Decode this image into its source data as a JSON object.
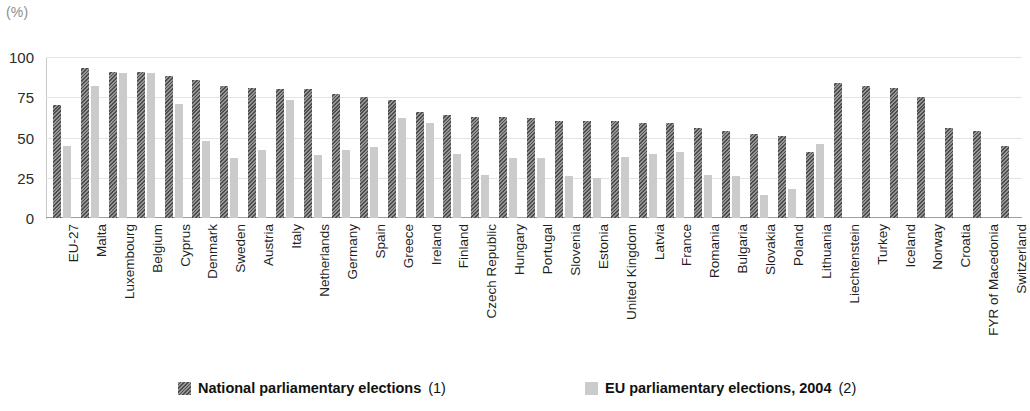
{
  "chart_data": {
    "type": "bar",
    "title": "",
    "xlabel": "",
    "ylabel": "(%)",
    "unit_label": "(%)",
    "ylim": [
      0,
      100
    ],
    "yticks": [
      0,
      25,
      50,
      75,
      100
    ],
    "grid": true,
    "legend_position": "bottom",
    "categories": [
      "EU-27",
      "Malta",
      "Luxembourg",
      "Belgium",
      "Cyprus",
      "Denmark",
      "Sweden",
      "Austria",
      "Italy",
      "Netherlands",
      "Germany",
      "Spain",
      "Greece",
      "Ireland",
      "Finland",
      "Czech Republic",
      "Hungary",
      "Portugal",
      "Slovenia",
      "Estonia",
      "United Kingdom",
      "Latvia",
      "France",
      "Romania",
      "Bulgaria",
      "Slovakia",
      "Poland",
      "Lithuania",
      "Liechtenstein",
      "Turkey",
      "Iceland",
      "Norway",
      "Croatia",
      "FYR of Macedonia",
      "Switzerland"
    ],
    "series": [
      {
        "name": "National parliamentary elections (1)",
        "color": "#6e6e6e",
        "pattern": "diagonal-hatch",
        "values": [
          70,
          93,
          91,
          91,
          88,
          86,
          82,
          81,
          80,
          80,
          77,
          75,
          73,
          66,
          64,
          63,
          63,
          62,
          60,
          60,
          60,
          59,
          59,
          56,
          54,
          52,
          51,
          41,
          84,
          82,
          81,
          75,
          56,
          54,
          45
        ]
      },
      {
        "name": "EU parliamentary elections, 2004 (2)",
        "color": "#cbcbcb",
        "pattern": "solid",
        "values": [
          45,
          82,
          90,
          90,
          71,
          48,
          37,
          42,
          73,
          39,
          42,
          44,
          62,
          59,
          40,
          27,
          37,
          37,
          26,
          25,
          38,
          40,
          41,
          27,
          26,
          14,
          18,
          46,
          null,
          null,
          null,
          null,
          null,
          null,
          null
        ]
      }
    ],
    "legend": [
      {
        "label": "National parliamentary elections",
        "note": "(1)",
        "swatch": "dark-hatched"
      },
      {
        "label": "EU parliamentary elections, 2004",
        "note": "(2)",
        "swatch": "light-solid"
      }
    ]
  }
}
